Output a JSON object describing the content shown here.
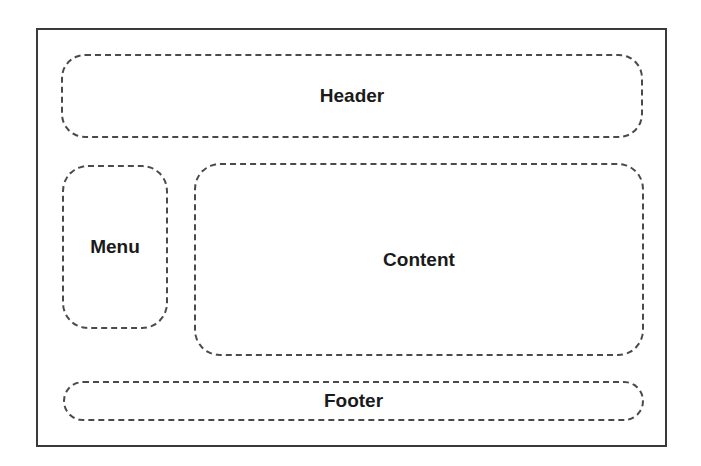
{
  "diagram": {
    "type": "page-layout-wireframe",
    "regions": {
      "header": {
        "label": "Header"
      },
      "menu": {
        "label": "Menu"
      },
      "content": {
        "label": "Content"
      },
      "footer": {
        "label": "Footer"
      }
    },
    "colors": {
      "frame": "#3a3a3a",
      "dashed_border": "#4a4a4a",
      "text": "#1a1a1a",
      "background": "#ffffff"
    }
  }
}
